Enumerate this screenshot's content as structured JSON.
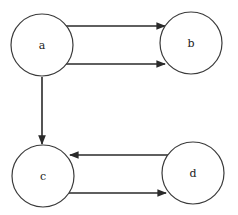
{
  "diagram": {
    "type": "directed-graph",
    "stroke_color": "#2a2a2a",
    "nodes": [
      {
        "id": "a",
        "label": "a",
        "cx": 42,
        "cy": 45,
        "r": 31
      },
      {
        "id": "b",
        "label": "b",
        "cx": 191,
        "cy": 43,
        "r": 31
      },
      {
        "id": "c",
        "label": "c",
        "cx": 43,
        "cy": 176,
        "r": 31
      },
      {
        "id": "d",
        "label": "d",
        "cx": 193,
        "cy": 173,
        "r": 31
      }
    ],
    "edges": [
      {
        "from": "a",
        "to": "b",
        "position": "upper"
      },
      {
        "from": "a",
        "to": "b",
        "position": "lower"
      },
      {
        "from": "a",
        "to": "c",
        "position": "vertical"
      },
      {
        "from": "d",
        "to": "c",
        "position": "upper"
      },
      {
        "from": "c",
        "to": "d",
        "position": "lower"
      }
    ]
  }
}
